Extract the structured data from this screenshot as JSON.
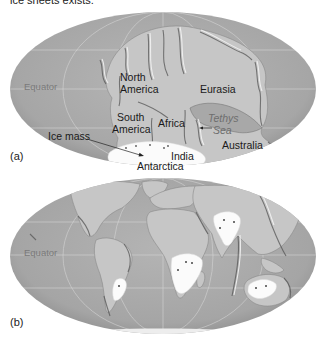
{
  "caption": "ice sheets exists.",
  "maps": [
    {
      "panel": "(a)",
      "equator_label": "Equator",
      "labels": {
        "north_america": [
          "North",
          "America"
        ],
        "south_america": [
          "South",
          "America"
        ],
        "eurasia": "Eurasia",
        "africa": "Africa",
        "tethys_sea": [
          "Tethys",
          "Sea"
        ],
        "australia": "Australia",
        "india": "India",
        "antarctica": "Antarctica",
        "ice_mass": "Ice mass"
      }
    },
    {
      "panel": "(b)",
      "equator_label": "Equator"
    }
  ],
  "colors": {
    "ocean": "#a9a9a9",
    "land": "#c6c6c6",
    "ice": "#fbfbfb",
    "background": "#ffffff"
  }
}
